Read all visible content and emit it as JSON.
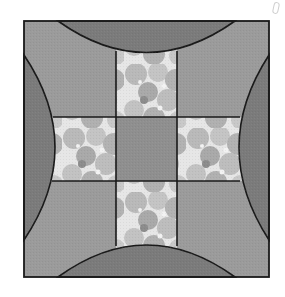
{
  "diagram": {
    "type": "quilt-block",
    "block": {
      "left": 24,
      "top": 21,
      "right": 269,
      "bottom": 277
    },
    "cross": {
      "center": {
        "left": 116,
        "top": 117,
        "right": 177,
        "bottom": 181
      },
      "arm_top": {
        "top": 52
      },
      "arm_bottom": {
        "bottom": 245
      },
      "arm_left": {
        "left": 52
      },
      "arm_right": {
        "right": 239
      }
    },
    "arcs": {
      "top": {
        "start_x": 58,
        "end_x": 235,
        "peak_y": 52
      },
      "bottom": {
        "start_x": 58,
        "end_x": 235,
        "peak_y": 245
      },
      "left": {
        "start_y": 55,
        "end_y": 240,
        "peak_x": 55
      },
      "right": {
        "start_y": 55,
        "end_y": 240,
        "peak_x": 239
      }
    },
    "colors": {
      "outline": "#1a1a1a",
      "corner_fill": "#9b9b9b",
      "arc_fill": "#7b7b7b",
      "center_fill": "#8f8f8f",
      "floral_light": "#e8e8e8",
      "floral_mid": "#b5b5b5",
      "floral_dark": "#8a8a8a",
      "background": "#ffffff"
    },
    "pieces": [
      {
        "name": "corner-top-left",
        "fabric": "solid-medium-gray"
      },
      {
        "name": "corner-top-right",
        "fabric": "solid-medium-gray"
      },
      {
        "name": "corner-bottom-left",
        "fabric": "solid-medium-gray"
      },
      {
        "name": "corner-bottom-right",
        "fabric": "solid-medium-gray"
      },
      {
        "name": "arc-top",
        "fabric": "solid-dark-gray"
      },
      {
        "name": "arc-bottom",
        "fabric": "solid-dark-gray"
      },
      {
        "name": "arc-left",
        "fabric": "solid-dark-gray"
      },
      {
        "name": "arc-right",
        "fabric": "solid-dark-gray"
      },
      {
        "name": "cross-center",
        "fabric": "solid-gray"
      },
      {
        "name": "cross-arm-top",
        "fabric": "floral-print"
      },
      {
        "name": "cross-arm-bottom",
        "fabric": "floral-print"
      },
      {
        "name": "cross-arm-left",
        "fabric": "floral-print"
      },
      {
        "name": "cross-arm-right",
        "fabric": "floral-print"
      }
    ]
  }
}
